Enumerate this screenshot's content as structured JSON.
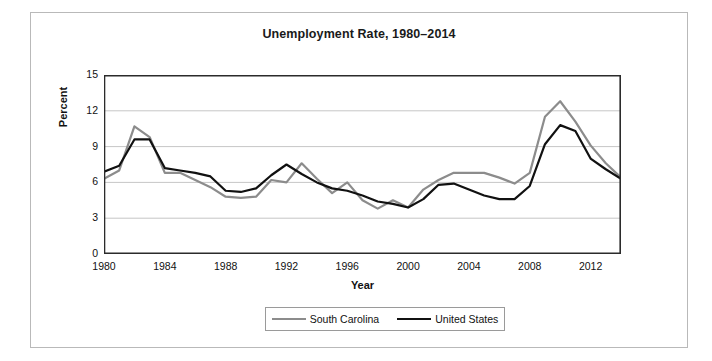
{
  "chart_data": {
    "type": "line",
    "title": "Unemployment Rate, 1980–2014",
    "xlabel": "Year",
    "ylabel": "Percent",
    "xlim": [
      1980,
      2014
    ],
    "ylim": [
      0,
      15
    ],
    "ytick_labels": [
      "15",
      "12",
      "9",
      "6",
      "3",
      "0"
    ],
    "yticks": [
      15,
      12,
      9,
      6,
      3,
      0
    ],
    "xtick_labels": [
      "1980",
      "1984",
      "1988",
      "1992",
      "1996",
      "2000",
      "2004",
      "2008",
      "2012"
    ],
    "xticks": [
      1980,
      1984,
      1988,
      1992,
      1996,
      2000,
      2004,
      2008,
      2012
    ],
    "grid": "horizontal",
    "legend_position": "bottom",
    "x": [
      1980,
      1981,
      1982,
      1983,
      1984,
      1985,
      1986,
      1987,
      1988,
      1989,
      1990,
      1991,
      1992,
      1993,
      1994,
      1995,
      1996,
      1997,
      1998,
      1999,
      2000,
      2001,
      2002,
      2003,
      2004,
      2005,
      2006,
      2007,
      2008,
      2009,
      2010,
      2011,
      2012,
      2013,
      2014
    ],
    "series": [
      {
        "name": "South Carolina",
        "color": "#8c8c8c",
        "values": [
          6.3,
          7.0,
          10.7,
          9.8,
          6.8,
          6.8,
          6.2,
          5.6,
          4.8,
          4.7,
          4.8,
          6.2,
          6.0,
          7.6,
          6.3,
          5.1,
          6.0,
          4.5,
          3.8,
          4.5,
          3.9,
          5.4,
          6.2,
          6.8,
          6.8,
          6.8,
          6.4,
          5.9,
          6.8,
          11.5,
          12.8,
          11.1,
          9.1,
          7.6,
          6.4
        ]
      },
      {
        "name": "United States",
        "color": "#111111",
        "values": [
          6.9,
          7.4,
          9.6,
          9.6,
          7.2,
          7.0,
          6.8,
          6.5,
          5.3,
          5.2,
          5.5,
          6.6,
          7.5,
          6.7,
          6.0,
          5.5,
          5.3,
          4.9,
          4.4,
          4.2,
          3.9,
          4.6,
          5.8,
          5.9,
          5.4,
          4.9,
          4.6,
          4.6,
          5.7,
          9.2,
          10.8,
          10.3,
          8.0,
          7.1,
          6.3
        ]
      }
    ]
  }
}
